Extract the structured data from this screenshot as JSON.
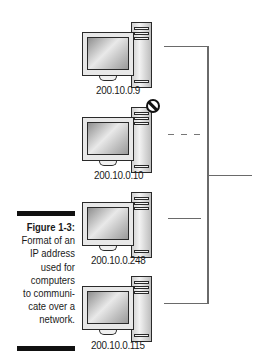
{
  "figure": {
    "number_label": "Figure 1-3:",
    "caption_lines": [
      "Format of an",
      "IP address",
      "used for",
      "computers",
      "to communi-",
      "cate over a",
      "network."
    ]
  },
  "computers": [
    {
      "ip": "200.10.0.9",
      "connected": true,
      "blocked": false
    },
    {
      "ip": "200.10.0.10",
      "connected": false,
      "blocked": true
    },
    {
      "ip": "200.10.0.248",
      "connected": true,
      "blocked": false
    },
    {
      "ip": "200.10.0.115",
      "connected": true,
      "blocked": false
    }
  ],
  "icons": {
    "computer": "desktop-computer-icon",
    "blocked": "no-entry-icon"
  },
  "colors": {
    "line": "#6a6a6a",
    "text": "#1a1a1a",
    "caption_bar": "#111111"
  }
}
